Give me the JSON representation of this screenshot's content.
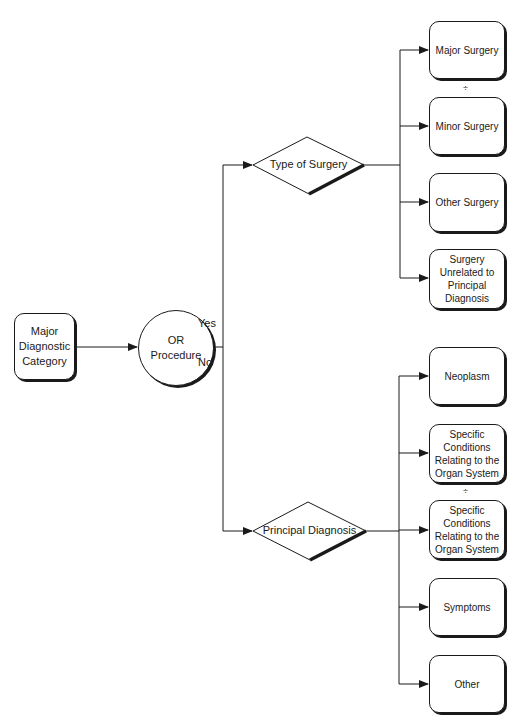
{
  "diagram": {
    "start": {
      "label": "Major Diagnostic Category"
    },
    "decision": {
      "label": "OR Procedure",
      "yes_label": "Yes",
      "no_label": "No"
    },
    "surgery_branch": {
      "label": "Type of Surgery",
      "outcomes": [
        {
          "label": "Major Surgery"
        },
        {
          "label": "Minor Surgery"
        },
        {
          "label": "Other Surgery"
        },
        {
          "label": "Surgery Unrelated to Principal Diagnosis"
        }
      ],
      "separator": "÷"
    },
    "diagnosis_branch": {
      "label": "Principal Diagnosis",
      "outcomes": [
        {
          "label": "Neoplasm"
        },
        {
          "label": "Specific Conditions Relating to the Organ System"
        },
        {
          "label": "Specific Conditions Relating to the Organ System"
        },
        {
          "label": "Symptoms"
        },
        {
          "label": "Other"
        }
      ],
      "separator": "÷"
    },
    "colors": {
      "line": "#1a1a1a",
      "background": "#ffffff"
    }
  }
}
